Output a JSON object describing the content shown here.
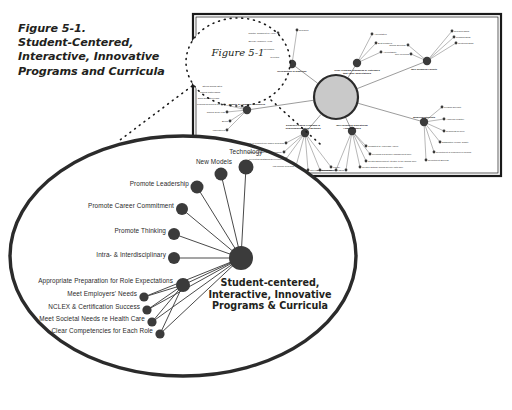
{
  "figure": {
    "title_lines": [
      "Figure 5-1.",
      "Student-Centered,",
      "Interactive, Innovative",
      "Programs and Curricula"
    ],
    "callout_label": "Figure 5-1"
  },
  "colors": {
    "node": "#3b3b3b",
    "line": "#4a4a4a",
    "circle_outline": "#2b2b2b",
    "panel_border": "#1a1a1a",
    "hub_fill": "#c9c9c9",
    "hub_ring": "#2b2b2b",
    "text": "#231f20"
  },
  "magnified_view": {
    "hub": {
      "label_lines": [
        "Student-centered,",
        "Interactive, Innovative",
        "Programs & Curricula"
      ],
      "cx": 241,
      "cy": 258,
      "r": 12
    },
    "nodes": [
      {
        "label": "Technology",
        "cx": 246,
        "cy": 167,
        "r": 7.5,
        "label_x": 246,
        "label_y": 152,
        "anchor": "center"
      },
      {
        "label": "New Models",
        "cx": 221,
        "cy": 174,
        "r": 6.5,
        "label_x": 214,
        "label_y": 162,
        "anchor": "center"
      },
      {
        "label": "Promote Leadership",
        "cx": 197,
        "cy": 187,
        "r": 6.5,
        "label_x": 189,
        "label_y": 184,
        "anchor": "right"
      },
      {
        "label": "Promote Career Commitment",
        "cx": 182,
        "cy": 209,
        "r": 6.0,
        "label_x": 174,
        "label_y": 206,
        "anchor": "right"
      },
      {
        "label": "Promote Thinking",
        "cx": 174,
        "cy": 234,
        "r": 6.0,
        "label_x": 166,
        "label_y": 231,
        "anchor": "right"
      },
      {
        "label": "Intra- & Interdisciplinary",
        "cx": 174,
        "cy": 258,
        "r": 6.0,
        "label_x": 166,
        "label_y": 255,
        "anchor": "right"
      },
      {
        "label": "Appropriate Preparation for Role Expectations",
        "cx": 183,
        "cy": 285,
        "r": 7.0,
        "label_x": 173,
        "label_y": 281,
        "anchor": "right"
      },
      {
        "label": "Meet Employers' Needs",
        "cx": 144,
        "cy": 297,
        "r": 4.6,
        "label_x": 137,
        "label_y": 294,
        "anchor": "right"
      },
      {
        "label": "NCLEX & Certification Success",
        "cx": 147,
        "cy": 310,
        "r": 4.6,
        "label_x": 140,
        "label_y": 307,
        "anchor": "right"
      },
      {
        "label": "Meet Societal Needs re Health Care",
        "cx": 152,
        "cy": 322,
        "r": 4.6,
        "label_x": 145,
        "label_y": 319,
        "anchor": "right"
      },
      {
        "label": "Clear Competencies for Each Role",
        "cx": 160,
        "cy": 334,
        "r": 4.6,
        "label_x": 153,
        "label_y": 331,
        "anchor": "right"
      }
    ],
    "circle": {
      "cx": 183,
      "cy": 256,
      "rx": 173,
      "ry": 120
    }
  },
  "mini_map": {
    "panel": {
      "x": 193,
      "y": 14,
      "w": 308,
      "h": 162
    },
    "hub": {
      "cx": 336,
      "cy": 97,
      "r": 22
    },
    "branches": [
      {
        "name": "Recognition of Expertise",
        "cx": 292,
        "cy": 64,
        "r": 4.2,
        "label_x": 292,
        "label_y": 70,
        "anchor": "center",
        "leaves": [
          {
            "label": "Practice Judgment on Acuity",
            "x": 278,
            "y": 33
          },
          {
            "label": "Special Advanced Areas",
            "x": 274,
            "y": 41
          },
          {
            "label": "Informatics",
            "x": 276,
            "y": 49
          },
          {
            "label": "Genetics",
            "x": 281,
            "y": 57
          },
          {
            "label": "Research",
            "x": 297,
            "y": 30
          }
        ]
      },
      {
        "name": "Clear Program Standards & Outcomes that Value Expectations",
        "cx": 357,
        "cy": 63,
        "r": 4.2,
        "label_x": 357,
        "label_y": 69,
        "anchor": "center",
        "leaves": [
          {
            "label": "Accreditation",
            "x": 372,
            "y": 34
          },
          {
            "label": "Best Practices",
            "x": 376,
            "y": 43
          },
          {
            "label": "Accountability",
            "x": 381,
            "y": 52
          }
        ]
      },
      {
        "name": "Well-prepared Faculty",
        "cx": 427,
        "cy": 61,
        "r": 4.2,
        "label_x": 424,
        "label_y": 68,
        "anchor": "center",
        "leaves": [
          {
            "label": "Clinical Expertise",
            "x": 408,
            "y": 45
          },
          {
            "label": "Role Modeling",
            "x": 411,
            "y": 54
          },
          {
            "label": "Research Skills",
            "x": 452,
            "y": 31
          },
          {
            "label": "Teaching Skills",
            "x": 454,
            "y": 37
          },
          {
            "label": "Mentoring Skills",
            "x": 456,
            "y": 43
          }
        ]
      },
      {
        "name": "Qualified Students",
        "cx": 424,
        "cy": 122,
        "r": 4.2,
        "label_x": 424,
        "label_y": 116,
        "anchor": "center",
        "leaves": [
          {
            "label": "Program Diversity",
            "x": 442,
            "y": 107
          },
          {
            "label": "Academic Practice",
            "x": 444,
            "y": 119
          },
          {
            "label": "Readiness for Role",
            "x": 444,
            "y": 131
          },
          {
            "label": "Satisfaction of Care Quality",
            "x": 440,
            "y": 142
          },
          {
            "label": "Recruitment of Underserved Groups",
            "x": 434,
            "y": 152
          },
          {
            "label": "Recruitment Success",
            "x": 426,
            "y": 160
          }
        ]
      },
      {
        "name": "Well-prepared Educational Administrators",
        "cx": 352,
        "cy": 131,
        "r": 4.2,
        "label_x": 352,
        "label_y": 124,
        "anchor": "center",
        "leaves": [
          {
            "label": "Consistent & Achievable Vision",
            "x": 366,
            "y": 146
          },
          {
            "label": "Providing a Resource Management Role",
            "x": 370,
            "y": 154
          },
          {
            "label": "Creates Environment Attentive to the Clinical Role",
            "x": 366,
            "y": 161
          },
          {
            "label": "Creates Optimal Clinical Service with Care",
            "x": 360,
            "y": 167
          },
          {
            "label": "Political Skills",
            "x": 336,
            "y": 170
          },
          {
            "label": "Time for Management Skills",
            "x": 346,
            "y": 170
          }
        ]
      },
      {
        "name": "Evidence-based Programs & Teaching/Evaluation Methods",
        "cx": 305,
        "cy": 133,
        "r": 4.2,
        "label_x": 303,
        "label_y": 124,
        "anchor": "center",
        "leaves": [
          {
            "label": "Focus on Competency-based Research",
            "x": 286,
            "y": 143
          },
          {
            "label": "Qualified Clinically Relevant Faculty",
            "x": 284,
            "y": 152
          },
          {
            "label": "Preceptors Sustaining Development",
            "x": 286,
            "y": 159
          },
          {
            "label": "Lab Clinical Research",
            "x": 296,
            "y": 166
          },
          {
            "label": "Inter-Intranet",
            "x": 308,
            "y": 170
          },
          {
            "label": "Simulation",
            "x": 320,
            "y": 170
          },
          {
            "label": "Faculty",
            "x": 331,
            "y": 167
          }
        ]
      },
      {
        "name": "Quality & Adequate Resources",
        "cx": 247,
        "cy": 110,
        "r": 4.2,
        "label_x": 247,
        "label_y": 103,
        "anchor": "center",
        "leaves": [
          {
            "label": "Strong Clinical Sites",
            "x": 224,
            "y": 86
          },
          {
            "label": "Clinical Partnerships",
            "x": 222,
            "y": 92
          },
          {
            "label": "Skills Simulation Labs",
            "x": 221,
            "y": 98
          },
          {
            "label": "Learning Resources Ctr",
            "x": 222,
            "y": 104
          },
          {
            "label": "Clinical Tools / Lab",
            "x": 227,
            "y": 112
          },
          {
            "label": "Books",
            "x": 230,
            "y": 121
          },
          {
            "label": "Laboratories",
            "x": 227,
            "y": 130
          }
        ]
      }
    ]
  }
}
